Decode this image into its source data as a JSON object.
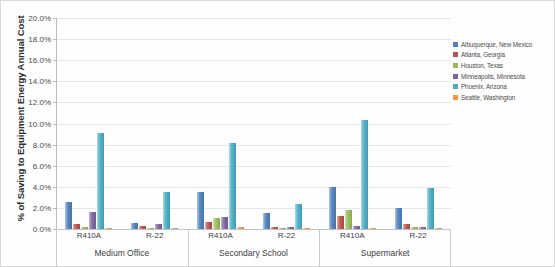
{
  "chart": {
    "y_axis_title": "% of Saving to Equipment Energy Annual Cost",
    "y_ticks": [
      "20.0%",
      "18.0%",
      "16.0%",
      "14.0%",
      "12.0%",
      "10.0%",
      "8.0%",
      "6.0%",
      "4.0%",
      "2.0%",
      "0.0%"
    ]
  },
  "chart_data": {
    "type": "bar",
    "title": "",
    "xlabel": "",
    "ylabel": "% of Saving to Equipment Energy Annual Cost",
    "ylim": [
      0,
      20
    ],
    "ytick_values": [
      0,
      2,
      4,
      6,
      8,
      10,
      12,
      14,
      16,
      18,
      20
    ],
    "ytick_labels": [
      "0.0%",
      "2.0%",
      "4.0%",
      "6.0%",
      "8.0%",
      "10.0%",
      "12.0%",
      "14.0%",
      "16.0%",
      "18.0%",
      "20.0%"
    ],
    "grid": true,
    "legend_position": "right",
    "categories": [
      "R410A",
      "R-22",
      "R410A",
      "R-22",
      "R410A",
      "R-22"
    ],
    "category_groups": [
      {
        "label": "Medium Office",
        "subcategories": [
          "R410A",
          "R-22"
        ]
      },
      {
        "label": "Secondary School",
        "subcategories": [
          "R410A",
          "R-22"
        ]
      },
      {
        "label": "Supermarket",
        "subcategories": [
          "R410A",
          "R-22"
        ]
      }
    ],
    "series": [
      {
        "name": "Albuquerque, New Mexico",
        "color": "#4f81bd",
        "values": [
          2.6,
          0.6,
          3.5,
          1.5,
          4.0,
          2.0
        ]
      },
      {
        "name": "Atlanta, Georgia",
        "color": "#c0504d",
        "values": [
          0.5,
          0.3,
          0.7,
          0.2,
          1.2,
          0.5
        ]
      },
      {
        "name": "Houston, Texas",
        "color": "#9bbb59",
        "values": [
          0.15,
          0.1,
          1.0,
          0.1,
          1.8,
          0.2
        ]
      },
      {
        "name": "Minneapolis, Minnesota",
        "color": "#8064a2",
        "values": [
          1.6,
          0.5,
          1.1,
          0.2,
          0.3,
          0.15
        ]
      },
      {
        "name": "Phoenix, Arizona",
        "color": "#4bacc6",
        "values": [
          9.1,
          3.5,
          8.2,
          2.4,
          10.3,
          3.9
        ]
      },
      {
        "name": "Seattle, Washington",
        "color": "#f79646",
        "values": [
          0.1,
          0.05,
          0.15,
          0.05,
          0.1,
          0.05
        ]
      }
    ]
  }
}
